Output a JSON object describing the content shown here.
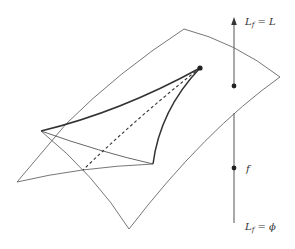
{
  "diagram": {
    "type": "geometric-illustration",
    "colors": {
      "stroke": "#555555",
      "thick_stroke": "#333333",
      "background": "#ffffff",
      "point": "#222222"
    },
    "labels": {
      "top": {
        "base": "L",
        "subscript": "f",
        "relation": " = ",
        "rhs": "L"
      },
      "middle": {
        "text": "f"
      },
      "bottom": {
        "base": "L",
        "subscript": "f",
        "relation": " = ",
        "rhs": "ϕ"
      }
    },
    "elements": [
      "upper-surface",
      "lower-surface",
      "curved-triangle",
      "dashed-diagonal",
      "apex-point",
      "vertical-axis-arrow",
      "point-L",
      "point-f"
    ]
  }
}
